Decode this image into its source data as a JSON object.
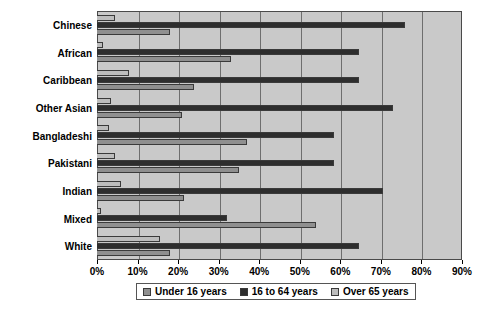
{
  "chart_data": {
    "type": "bar",
    "orientation": "horizontal",
    "title": "",
    "xlabel": "",
    "ylabel": "",
    "xlim": [
      0,
      90
    ],
    "xtick_labels": [
      "0%",
      "10%",
      "20%",
      "30%",
      "40%",
      "50%",
      "60%",
      "70%",
      "80%",
      "90%"
    ],
    "xtick_values": [
      0,
      10,
      20,
      30,
      40,
      50,
      60,
      70,
      80,
      90
    ],
    "grid": true,
    "legend_position": "bottom",
    "categories": [
      "Chinese",
      "African",
      "Caribbean",
      "Other Asian",
      "Bangladeshi",
      "Pakistani",
      "Indian",
      "Mixed",
      "White"
    ],
    "series": [
      {
        "name": "Under 16 years",
        "color": "#8f8f8f",
        "values": [
          18,
          33,
          24,
          21,
          37,
          35,
          21.5,
          54,
          18
        ]
      },
      {
        "name": "16 to 64 years",
        "color": "#2e2e2e",
        "values": [
          76,
          64.5,
          64.5,
          73,
          58.5,
          58.5,
          70.5,
          32,
          64.5
        ]
      },
      {
        "name": "Over 65 years",
        "color": "#bdbdbd",
        "values": [
          4.5,
          1.5,
          8,
          3.5,
          3,
          4.5,
          6,
          1,
          15.5
        ]
      }
    ],
    "plot_background": "#c9c9c9",
    "gridline_color": "#6e6e6e",
    "border_color": "#4a4a4a"
  },
  "legend": {
    "items": [
      {
        "label": "Under 16 years"
      },
      {
        "label": "16 to 64 years"
      },
      {
        "label": "Over 65 years"
      }
    ]
  }
}
